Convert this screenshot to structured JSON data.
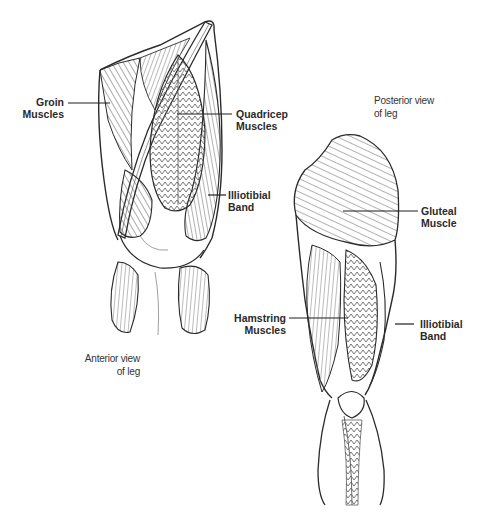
{
  "diagram": {
    "type": "anatomical-illustration",
    "line_color": "#2a2a2a",
    "sketch_color": "#555555",
    "views": [
      {
        "id": "anterior",
        "caption": [
          "Anterior view",
          "of leg"
        ],
        "labels": [
          {
            "id": "groin",
            "lines": [
              "Groin",
              "Muscles"
            ]
          },
          {
            "id": "quadricep",
            "lines": [
              "Quadricep",
              "Muscles"
            ]
          },
          {
            "id": "illiotibial",
            "lines": [
              "Illiotibial",
              "Band"
            ]
          }
        ]
      },
      {
        "id": "posterior",
        "caption": [
          "Posterior view",
          "of leg"
        ],
        "labels": [
          {
            "id": "gluteal",
            "lines": [
              "Gluteal",
              "Muscle"
            ]
          },
          {
            "id": "hamstring",
            "lines": [
              "Hamstring",
              "Muscles"
            ]
          },
          {
            "id": "illiotibial",
            "lines": [
              "Illiotibial",
              "Band"
            ]
          }
        ]
      }
    ]
  }
}
